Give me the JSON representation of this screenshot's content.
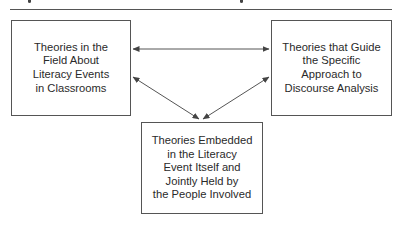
{
  "figure": {
    "boxes": {
      "left": {
        "label": "Theories in the\nField About\nLiteracy Events\nin Classrooms"
      },
      "right": {
        "label": "Theories that Guide\nthe Specific\nApproach to\nDiscourse Analysis"
      },
      "bottom": {
        "label": "Theories Embedded\nin the Literacy\nEvent Itself and\nJointly Held by\nthe People Involved"
      }
    },
    "connections": [
      {
        "from": "left",
        "to": "right",
        "type": "bidirectional"
      },
      {
        "from": "left",
        "to": "bottom",
        "type": "bidirectional"
      },
      {
        "from": "right",
        "to": "bottom",
        "type": "bidirectional"
      }
    ],
    "colors": {
      "line": "#555555",
      "text": "#2a2a2a",
      "background": "#ffffff"
    }
  }
}
